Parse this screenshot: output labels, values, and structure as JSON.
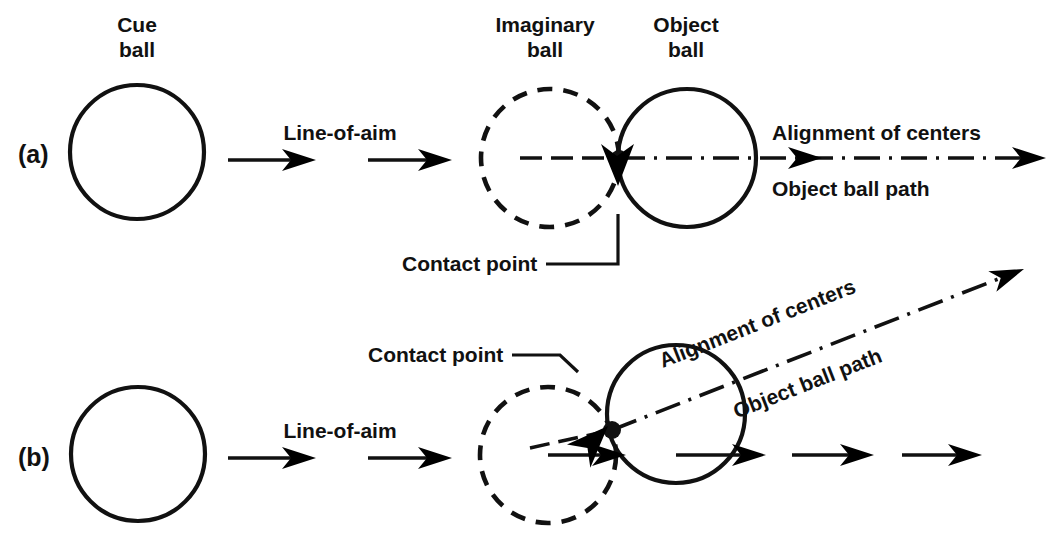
{
  "figure": {
    "background_color": "#ffffff",
    "ink_color": "#111111",
    "width": 1053,
    "height": 550
  },
  "panels": [
    {
      "id": "a",
      "label": "(a)",
      "description": "Full (straight-on) hit: cue ball, imaginary ball and object ball centers all on one line",
      "labels": {
        "cue_ball": "Cue\nball",
        "cue_ball_line1": "Cue",
        "cue_ball_line2": "ball",
        "imaginary_ball_line1": "Imaginary",
        "imaginary_ball_line2": "ball",
        "object_ball_line1": "Object",
        "object_ball_line2": "ball",
        "line_of_aim": "Line-of-aim",
        "contact_point": "Contact point",
        "alignment_of_centers": "Alignment of centers",
        "object_ball_path": "Object ball path"
      }
    },
    {
      "id": "b",
      "label": "(b)",
      "description": "Cut shot: imaginary ball offset, object ball path angled away from line-of-aim",
      "labels": {
        "line_of_aim": "Line-of-aim",
        "contact_point": "Contact point",
        "alignment_of_centers": "Alignment of centers",
        "object_ball_path": "Object ball path"
      }
    }
  ],
  "geometry": {
    "panel_a": {
      "cue_ball": {
        "cx": 137,
        "cy": 152,
        "r": 67,
        "style": "solid"
      },
      "imaginary_ball": {
        "cx": 550,
        "cy": 158,
        "r": 69,
        "style": "dashed"
      },
      "object_ball": {
        "cx": 687,
        "cy": 158,
        "r": 69,
        "style": "solid"
      },
      "contact_point": {
        "x": 619,
        "y": 158
      },
      "aim_axis_y": 160,
      "path_angle_deg": 0
    },
    "panel_b": {
      "cue_ball": {
        "cx": 138,
        "cy": 454,
        "r": 67,
        "style": "solid"
      },
      "imaginary_ball": {
        "cx": 548,
        "cy": 455,
        "r": 68,
        "style": "dashed"
      },
      "object_ball": {
        "cx": 676,
        "cy": 414,
        "r": 69,
        "style": "solid"
      },
      "contact_point": {
        "x": 612,
        "y": 430
      },
      "aim_axis_y": 455,
      "path_angle_deg": -17.5
    }
  }
}
